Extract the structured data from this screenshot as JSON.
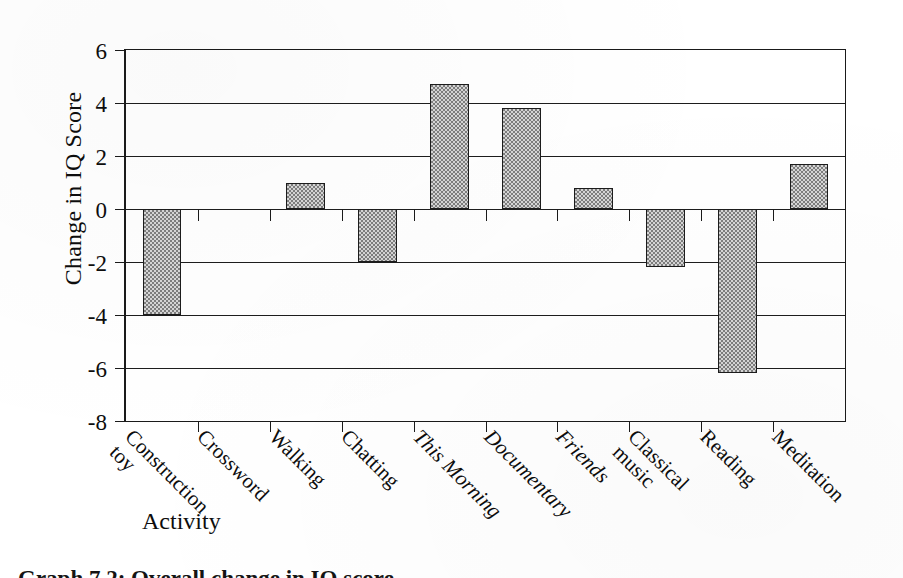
{
  "chart_data": {
    "type": "bar",
    "title": "",
    "xlabel": "Activity",
    "ylabel": "Change in IQ Score",
    "ylim": [
      -8,
      6
    ],
    "ytick_step": 2,
    "yticks": [
      "6",
      "4",
      "2",
      "0",
      "-2",
      "-4",
      "-6",
      "-8"
    ],
    "grid": true,
    "legend": "none",
    "categories": [
      "Construction toy",
      "Crossword",
      "Walking",
      "Chatting",
      "This Morning",
      "Documentary",
      "Friends",
      "Classical music",
      "Reading",
      "Meditation"
    ],
    "category_lines": [
      [
        "Construction",
        "toy"
      ],
      [
        "Crossword"
      ],
      [
        "Walking"
      ],
      [
        "Chatting"
      ],
      [
        "This Morning"
      ],
      [
        "Documentary"
      ],
      [
        "Friends"
      ],
      [
        "Classical",
        "music"
      ],
      [
        "Reading"
      ],
      [
        "Meditation"
      ]
    ],
    "category_italic": [
      false,
      false,
      false,
      false,
      true,
      true,
      true,
      false,
      false,
      false
    ],
    "values": [
      -4.0,
      0.0,
      1.0,
      -2.0,
      4.7,
      3.8,
      0.8,
      -2.2,
      -6.2,
      1.7
    ],
    "bar_fill": "#a8a8a8",
    "bar_edge": "#1c1c1c",
    "axis_color": "#1a1a1a",
    "background": "#ffffff"
  },
  "caption": {
    "sliver_text": "Graph 7.2:  Overall change in IQ score"
  }
}
